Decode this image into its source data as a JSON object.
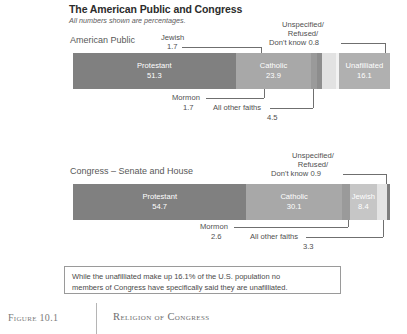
{
  "header": {
    "title": "The American Public and Congress",
    "subtitle": "All numbers shown are percentages."
  },
  "panels": {
    "public": {
      "label": "American Public",
      "annotations": {
        "jewish_name": "Jewish",
        "jewish_value": "1.7",
        "unspecified_line1": "Unspecified/",
        "unspecified_line2": "Refused/",
        "unspecified_line3": "Don't know 0.8",
        "mormon_name": "Mormon",
        "mormon_value": "1.7",
        "other_name": "All other faiths",
        "other_value": "4.5"
      }
    },
    "congress": {
      "label": "Congress – Senate and House",
      "annotations": {
        "unspecified_line1": "Unspecified/",
        "unspecified_line2": "Refused/",
        "unspecified_line3": "Don't know 0.9",
        "mormon_name": "Mormon",
        "mormon_value": "2.6",
        "other_name": "All other faiths",
        "other_value": "3.3"
      }
    }
  },
  "callout": {
    "line1": "While the unafilliated make up 16.1% of the U.S. population no",
    "line2": "members of Congress have specifically said they are unafilliated."
  },
  "figure": {
    "number": "Figure 10.1",
    "caption": "Religion of Congress"
  },
  "colors": {
    "protestant": "#808080",
    "catholic": "#a8a8a8",
    "mormon": "#8f8f8f",
    "other_faiths": "#bdbdbd",
    "unspecified": "#ededed",
    "unaffiliated": "#b0b0b0",
    "jewish": "#c6c6c6",
    "leader_line": "#6f6f6f"
  },
  "chart_data": {
    "type": "bar",
    "title": "The American Public and Congress",
    "subtitle": "All numbers shown are percentages.",
    "orientation": "horizontal-stacked",
    "unit": "percent",
    "xlim": [
      0,
      100
    ],
    "grid": false,
    "legend": "none",
    "categories": [
      "Protestant",
      "Catholic",
      "Mormon",
      "Jewish",
      "All other faiths",
      "Unspecified/Refused/Don't know",
      "Unaffiliated"
    ],
    "series": [
      {
        "name": "American Public",
        "values": [
          51.3,
          23.9,
          1.7,
          1.7,
          4.5,
          0.8,
          16.1
        ]
      },
      {
        "name": "Congress – Senate and House",
        "values": [
          54.7,
          30.1,
          2.6,
          8.4,
          3.3,
          0.9,
          0.0
        ]
      }
    ],
    "labeled_segments": [
      {
        "series": "American Public",
        "label": "Protestant",
        "value": "51.3"
      },
      {
        "series": "American Public",
        "label": "Catholic",
        "value": "23.9"
      },
      {
        "series": "American Public",
        "label": "Unafilliated",
        "value": "16.1"
      },
      {
        "series": "Congress – Senate and House",
        "label": "Protestant",
        "value": "54.7"
      },
      {
        "series": "Congress – Senate and House",
        "label": "Catholic",
        "value": "30.1"
      },
      {
        "series": "Congress – Senate and House",
        "label": "Jewish",
        "value": "8.4"
      }
    ],
    "annotation_note": "While the unafilliated make up 16.1% of the U.S. population no members of Congress have specifically said they are unafilliated."
  },
  "bars": {
    "public": [
      {
        "name": "Protestant",
        "value": "51.3",
        "showLabel": true,
        "color": "#808080"
      },
      {
        "name": "Catholic",
        "value": "23.9",
        "showLabel": true,
        "color": "#a8a8a8"
      },
      {
        "name": "Mormon",
        "value": "1.7",
        "showLabel": false,
        "color": "#9a9a9a"
      },
      {
        "name": "Jewish",
        "value": "1.7",
        "showLabel": false,
        "color": "#8d8d8d"
      },
      {
        "name": "All other faiths",
        "value": "4.5",
        "showLabel": false,
        "color": "#e2e2e2"
      },
      {
        "name": "Unspecified/Refused/Don't know",
        "value": "0.8",
        "showLabel": false,
        "color": "#f2f2f2"
      },
      {
        "name": "Unafilliated",
        "value": "16.1",
        "showLabel": true,
        "color": "#b0b0b0"
      }
    ],
    "congress": [
      {
        "name": "Protestant",
        "value": "54.7",
        "showLabel": true,
        "color": "#808080"
      },
      {
        "name": "Catholic",
        "value": "30.1",
        "showLabel": true,
        "color": "#a8a8a8"
      },
      {
        "name": "Mormon",
        "value": "2.6",
        "showLabel": false,
        "color": "#9a9a9a"
      },
      {
        "name": "Jewish",
        "value": "8.4",
        "showLabel": true,
        "color": "#c6c6c6"
      },
      {
        "name": "All other faiths",
        "value": "3.3",
        "showLabel": false,
        "color": "#e4e4e4"
      },
      {
        "name": "Unspecified/Refused/Don't know",
        "value": "0.9",
        "showLabel": false,
        "color": "#7e7e7e"
      }
    ]
  }
}
